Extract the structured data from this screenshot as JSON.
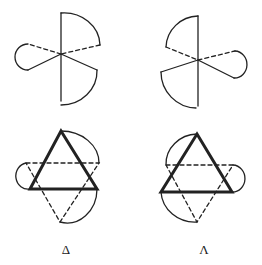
{
  "figures": [
    {
      "id": "top-left",
      "description": "Three-bladed propeller (chelate) with left lobe dashed"
    },
    {
      "id": "top-right",
      "description": "Three-bladed propeller (chelate), mirror image"
    },
    {
      "id": "bottom-left",
      "description": "Triangle projection of Delta isomer"
    },
    {
      "id": "bottom-right",
      "description": "Triangle projection of Lambda isomer"
    }
  ],
  "labels": {
    "delta": "Δ",
    "lambda": "Λ"
  },
  "colors": {
    "stroke": "#222222",
    "background": "#ffffff"
  }
}
